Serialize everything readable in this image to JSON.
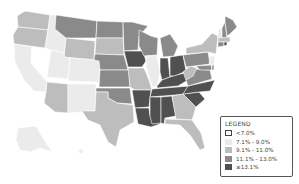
{
  "legend": {
    "title": "LEGEND",
    "items": [
      {
        "label": "<7.0%",
        "color": "#ffffff",
        "outlined": true
      },
      {
        "label": "7.1% - 9.0%",
        "color": "#ebebeb",
        "outlined": false
      },
      {
        "label": "9.1% - 11.0%",
        "color": "#bdbdbd",
        "outlined": false
      },
      {
        "label": "11.1% - 13.0%",
        "color": "#8a8a8a",
        "outlined": false
      },
      {
        "label": "≥13.1%",
        "color": "#505050",
        "outlined": false
      }
    ]
  },
  "colors": {
    "c0": "#ffffff",
    "c1": "#ebebeb",
    "c2": "#bdbdbd",
    "c3": "#8a8a8a",
    "c4": "#505050"
  },
  "states": [
    {
      "id": "WA",
      "cls": "c2",
      "points": "25,11 50,15 48,30 18,27 17,16"
    },
    {
      "id": "OR",
      "cls": "c2",
      "points": "18,27 48,30 45,48 14,44 13,35"
    },
    {
      "id": "CA",
      "cls": "c1",
      "points": "14,44 32,47 31,63 48,82 45,92 34,91 24,80 15,62"
    },
    {
      "id": "NV",
      "cls": "c0",
      "points": "32,47 51,50 47,82 31,63"
    },
    {
      "id": "ID",
      "cls": "c1",
      "points": "50,15 56,15 55,29 66,38 64,53 51,50 45,48 48,30"
    },
    {
      "id": "MT",
      "cls": "c3",
      "points": "56,15 97,21 96,38 66,38 55,29"
    },
    {
      "id": "WY",
      "cls": "c2",
      "points": "66,38 95,41 94,60 64,57"
    },
    {
      "id": "UT",
      "cls": "c1",
      "points": "51,50 64,53 64,57 70,58 68,79 47,77"
    },
    {
      "id": "AZ",
      "cls": "c2",
      "points": "47,82 68,84 68,113 55,112 44,103 46,92"
    },
    {
      "id": "CO",
      "cls": "c1",
      "points": "70,58 100,60 99,82 68,81"
    },
    {
      "id": "NM",
      "cls": "c1",
      "points": "68,84 96,84 95,111 68,113"
    },
    {
      "id": "ND",
      "cls": "c3",
      "points": "97,21 123,22 123,38 96,38"
    },
    {
      "id": "SD",
      "cls": "c2",
      "points": "96,38 123,38 124,55 95,54"
    },
    {
      "id": "NE",
      "cls": "c3",
      "points": "95,54 124,55 128,70 100,70 99,61 94,60"
    },
    {
      "id": "KS",
      "cls": "c3",
      "points": "100,70 129,70 130,87 99,87"
    },
    {
      "id": "OK",
      "cls": "c3",
      "points": "96,88 130,88 132,104 117,103 108,98 108,92 96,92"
    },
    {
      "id": "TX",
      "cls": "c2",
      "points": "96,92 108,92 108,98 117,103 133,105 134,122 120,130 116,147 108,142 100,125 88,120 82,111 95,111"
    },
    {
      "id": "MN",
      "cls": "c3",
      "points": "123,22 132,22 148,26 139,36 138,50 124,51"
    },
    {
      "id": "IA",
      "cls": "c4",
      "points": "124,51 143,51 146,61 142,67 128,67"
    },
    {
      "id": "MO",
      "cls": "c2",
      "points": "128,68 144,68 149,80 152,90 135,90 130,87"
    },
    {
      "id": "AR",
      "cls": "c4",
      "points": "132,90 151,90 149,107 135,108"
    },
    {
      "id": "LA",
      "cls": "c4",
      "points": "135,108 149,108 150,116 158,117 160,124 151,127 138,124"
    },
    {
      "id": "WI",
      "cls": "c3",
      "points": "139,30 151,36 158,38 157,55 144,56 139,46"
    },
    {
      "id": "IL",
      "cls": "c1",
      "points": "146,56 157,56 160,72 157,86 152,87 146,66"
    },
    {
      "id": "MI",
      "cls": "c3",
      "points": "160,38 170,34 178,46 174,56 163,57"
    },
    {
      "id": "IN",
      "cls": "c4",
      "points": "160,58 168,58 170,77 162,80 160,72"
    },
    {
      "id": "OH",
      "cls": "c4",
      "points": "170,57 183,55 186,71 175,76 170,76"
    },
    {
      "id": "KY",
      "cls": "c4",
      "points": "157,86 162,80 170,77 184,73 188,80 178,86 157,88"
    },
    {
      "id": "TN",
      "cls": "c4",
      "points": "152,89 190,86 188,94 150,97"
    },
    {
      "id": "MS",
      "cls": "c4",
      "points": "150,97 161,97 161,123 152,124 150,116"
    },
    {
      "id": "AL",
      "cls": "c4",
      "points": "161,97 172,96 176,116 165,118 164,124 161,123"
    },
    {
      "id": "GA",
      "cls": "c2",
      "points": "172,96 183,94 196,107 192,120 176,119"
    },
    {
      "id": "FL",
      "cls": "c2",
      "points": "165,119 192,120 201,133 205,148 200,150 190,135 180,125 165,124"
    },
    {
      "id": "SC",
      "cls": "c4",
      "points": "183,94 199,92 205,99 196,107"
    },
    {
      "id": "NC",
      "cls": "c4",
      "points": "188,86 215,80 210,91 199,92 183,94"
    },
    {
      "id": "VA",
      "cls": "c3",
      "points": "186,80 195,69 210,70 212,79 188,86"
    },
    {
      "id": "WV",
      "cls": "c2",
      "points": "183,72 190,66 197,68 193,76 186,80"
    },
    {
      "id": "PA",
      "cls": "c3",
      "points": "183,55 208,52 210,64 186,67"
    },
    {
      "id": "NY",
      "cls": "c2",
      "points": "186,48 202,44 212,33 218,36 216,54 208,52 186,54"
    },
    {
      "id": "NJ",
      "cls": "c1",
      "points": "210,56 215,56 214,67 209,66"
    },
    {
      "id": "MD",
      "cls": "c3",
      "points": "196,66 211,65 212,70 200,70"
    },
    {
      "id": "DE",
      "cls": "c3",
      "points": "212,65 214,65 214,70 212,70"
    },
    {
      "id": "VT",
      "cls": "c1",
      "points": "218,30 222,28 222,39 218,38"
    },
    {
      "id": "NH",
      "cls": "c3",
      "points": "222,28 225,22 227,38 222,39"
    },
    {
      "id": "ME",
      "cls": "c3",
      "points": "225,16 233,20 237,27 230,34 227,36 225,22"
    },
    {
      "id": "MA",
      "cls": "c2",
      "points": "218,38 230,37 230,42 218,42"
    },
    {
      "id": "CT",
      "cls": "c3",
      "points": "218,42 224,42 224,46 218,47"
    },
    {
      "id": "RI",
      "cls": "c4",
      "points": "224,42 227,42 227,45 224,46"
    },
    {
      "id": "AK",
      "cls": "c1",
      "points": "18,128 36,126 44,140 52,152 40,148 30,152 20,150 16,140"
    },
    {
      "id": "HI",
      "cls": "c1",
      "points": "78,150 82,149 84,152 80,154"
    }
  ]
}
